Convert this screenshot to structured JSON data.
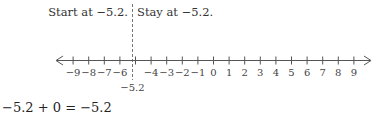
{
  "annotations": {
    "start_label": "Start at −5.2.",
    "stay_label": "Stay at −5.2.",
    "marker_label": "−5.2"
  },
  "number_line": {
    "min": -9,
    "max": 9,
    "step": 1,
    "tick_labels": [
      "−9",
      "−8",
      "−7",
      "−6",
      "",
      "−4",
      "−3",
      "−2",
      "−1",
      "0",
      "1",
      "2",
      "3",
      "4",
      "5",
      "6",
      "7",
      "8",
      "9"
    ],
    "marker_value": -5.2,
    "arrows": [
      "left-arrow",
      "right-arrow"
    ]
  },
  "equation": "−5.2 + 0 = −5.2",
  "colors": {
    "line": "#555555",
    "text": "#333333",
    "background": "#ffffff"
  }
}
